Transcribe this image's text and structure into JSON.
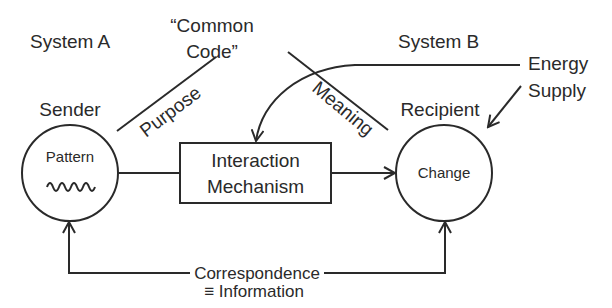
{
  "diagram": {
    "system_a_label": "System A",
    "system_b_label": "System B",
    "common_code_line1": "“Common",
    "common_code_line2": "Code”",
    "purpose_label": "Purpose",
    "meaning_label": "Meaning",
    "sender_label": "Sender",
    "recipient_label": "Recipient",
    "energy_line1": "Energy",
    "energy_line2": "Supply",
    "sender_node": {
      "text": "Pattern",
      "icon": "wave-icon"
    },
    "recipient_node": {
      "text": "Change"
    },
    "mechanism_line1": "Interaction",
    "mechanism_line2": "Mechanism",
    "correspondence_line1": "Correspondence",
    "correspondence_line2": "≡ Information"
  }
}
